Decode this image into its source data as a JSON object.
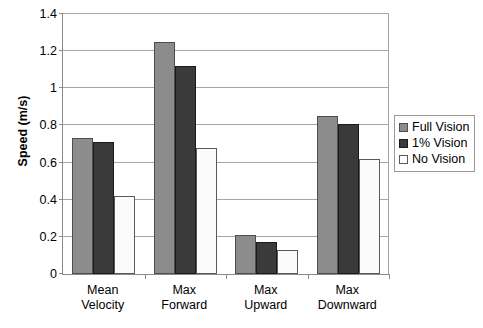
{
  "chart_data": {
    "type": "bar",
    "title": "",
    "xlabel": "",
    "ylabel": "Speed (m/s)",
    "ylim": [
      0,
      1.4
    ],
    "yticks": [
      "0",
      "0.2",
      "0.4",
      "0.6",
      "0.8",
      "1",
      "1.2",
      "1.4"
    ],
    "ytick_values": [
      0,
      0.2,
      0.4,
      0.6,
      0.8,
      1.0,
      1.2,
      1.4
    ],
    "grid": "horizontal",
    "legend_position": "right",
    "categories": [
      "Mean Velocity",
      "Max Forward",
      "Max Upward",
      "Max Downward"
    ],
    "category_lines": [
      [
        "Mean",
        "Velocity"
      ],
      [
        "Max",
        "Forward"
      ],
      [
        "Max",
        "Upward"
      ],
      [
        "Max",
        "Downward"
      ]
    ],
    "series": [
      {
        "name": "Full Vision",
        "color": "#8c8c8c",
        "values": [
          0.73,
          1.25,
          0.21,
          0.85
        ]
      },
      {
        "name": "1% Vision",
        "color": "#3a3a3a",
        "values": [
          0.71,
          1.12,
          0.17,
          0.81
        ]
      },
      {
        "name": "No Vision",
        "color": "#ffffff",
        "values": [
          0.42,
          0.68,
          0.13,
          0.62
        ]
      }
    ]
  }
}
